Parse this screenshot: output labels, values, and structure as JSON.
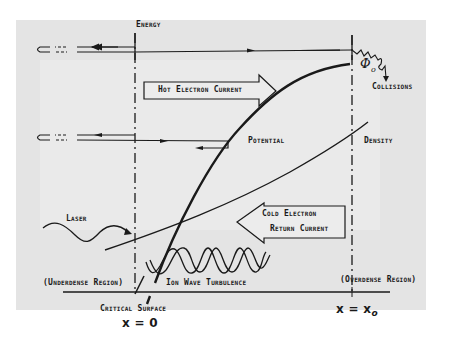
{
  "diagram": {
    "labels": {
      "energy": "Energy",
      "hot_electron_current": "Hot Electron Current",
      "collisions": "Collisions",
      "phi": "Φ",
      "phi_sub": "o",
      "potential": "Potential",
      "density": "Density",
      "laser": "Laser",
      "cold_electron_line1": "Cold Electron",
      "cold_electron_line2": "Return Current",
      "underdense_region": "(Underdense Region)",
      "overdense_region": "(Overdense Region)",
      "ion_wave_turbulence": "Ion Wave Turbulence",
      "critical_surface": "Critical Surface",
      "x_zero": "x = 0",
      "x_xo_main": "x = x",
      "x_xo_sub": "o"
    },
    "colors": {
      "ink": "#1a1a1a",
      "paper": "#e4e4e4",
      "background": "#ffffff"
    }
  }
}
